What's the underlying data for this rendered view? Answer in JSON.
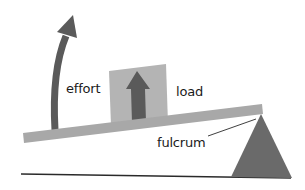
{
  "diagram": {
    "type": "lever",
    "labels": {
      "effort": "effort",
      "load": "load",
      "fulcrum": "fulcrum"
    },
    "colors": {
      "background": "#ffffff",
      "lever_bar": "#a8a8a8",
      "load_box": "#b4b4b4",
      "arrow": "#5a5a5a",
      "fulcrum": "#6a6a6a",
      "ground_line": "#2a2a2a",
      "text": "#1a1a1a"
    }
  }
}
